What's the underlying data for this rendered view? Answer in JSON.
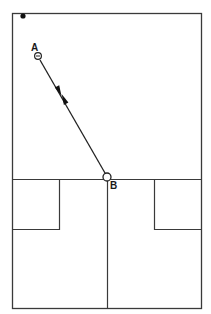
{
  "diagram": {
    "type": "court-diagram",
    "colors": {
      "line": "#3a3a3a",
      "background": "#ffffff",
      "marker": "#111111"
    },
    "labels": {
      "point_a": "A",
      "point_b": "B"
    },
    "points": {
      "a": {
        "x": 38,
        "y": 56
      },
      "b": {
        "x": 107,
        "y": 177
      },
      "corner_dot": {
        "x": 23,
        "y": 16
      }
    },
    "movement": {
      "from": "A",
      "to": "B",
      "direction": "both"
    }
  }
}
